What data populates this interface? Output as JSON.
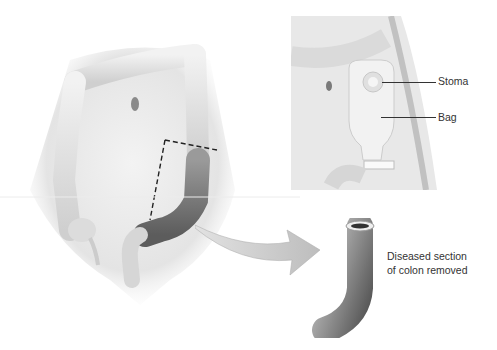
{
  "figure": {
    "main_view": {
      "description": "Front view of abdomen showing large intestine with dashed cut lines around diseased sigmoid/descending colon section"
    },
    "inset": {
      "description": "Abdomen with stoma and ostomy bag attached",
      "labels": {
        "stoma": "Stoma",
        "bag": "Bag"
      }
    },
    "removed_section": {
      "caption_line1": "Diseased section",
      "caption_line2": "of colon removed"
    },
    "colors": {
      "label_text": "#333333",
      "background": "#ffffff",
      "tissue_light": "#e6e6e6",
      "tissue_dark": "#6e6e6e",
      "dashed_line": "#222222"
    }
  }
}
